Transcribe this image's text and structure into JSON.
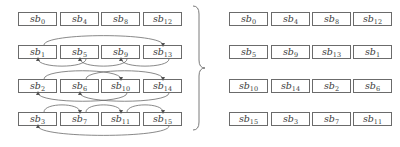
{
  "diagram": {
    "left_grid": [
      [
        "sb0",
        "sb4",
        "sb8",
        "sb12"
      ],
      [
        "sb1",
        "sb5",
        "sb9",
        "sb13"
      ],
      [
        "sb2",
        "sb6",
        "sb10",
        "sb14"
      ],
      [
        "sb3",
        "sb7",
        "sb11",
        "sb15"
      ]
    ],
    "right_grid": [
      [
        "sb0",
        "sb4",
        "sb8",
        "sb12"
      ],
      [
        "sb5",
        "sb9",
        "sb13",
        "sb1"
      ],
      [
        "sb10",
        "sb14",
        "sb2",
        "sb6"
      ],
      [
        "sb15",
        "sb3",
        "sb7",
        "sb11"
      ]
    ],
    "arrows": [
      {
        "row": 1,
        "from": "sb1",
        "to": "sb13",
        "side": "top"
      },
      {
        "row": 1,
        "from": "sb5",
        "to": "sb1",
        "side": "bottom"
      },
      {
        "row": 1,
        "from": "sb9",
        "to": "sb5",
        "side": "bottom"
      },
      {
        "row": 1,
        "from": "sb13",
        "to": "sb9",
        "side": "bottom"
      },
      {
        "row": 2,
        "from": "sb2",
        "to": "sb10",
        "side": "top"
      },
      {
        "row": 2,
        "from": "sb6",
        "to": "sb14",
        "side": "top"
      },
      {
        "row": 2,
        "from": "sb10",
        "to": "sb2",
        "side": "bottom"
      },
      {
        "row": 2,
        "from": "sb14",
        "to": "sb6",
        "side": "bottom"
      },
      {
        "row": 3,
        "from": "sb3",
        "to": "sb7",
        "side": "top"
      },
      {
        "row": 3,
        "from": "sb7",
        "to": "sb11",
        "side": "top"
      },
      {
        "row": 3,
        "from": "sb11",
        "to": "sb15",
        "side": "top"
      },
      {
        "row": 3,
        "from": "sb15",
        "to": "sb3",
        "side": "bottom"
      }
    ],
    "colors": {
      "stroke": "#6b6b6b",
      "text": "#3a3a3a"
    }
  }
}
